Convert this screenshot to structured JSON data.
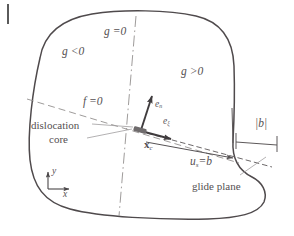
{
  "figure": {
    "domain_outline_color": "#4f4a4c",
    "dash_line_color": "#8d8a8c",
    "label_color": "#555052",
    "arrow_color": "#3f3b3d",
    "background": "#ffffff"
  },
  "labels": {
    "g_negative": "g <0",
    "g_zero": "g =0",
    "g_positive": "g >0",
    "f_zero": "f =0",
    "dislocation_core_line1": "dislocation",
    "dislocation_core_line2": "core",
    "e_n": "e",
    "e_n_sub": "n",
    "e_xi": "e",
    "e_xi_sub": "ξ",
    "x_c": "x",
    "x_c_sub": "c",
    "u_s": "u",
    "u_s_sub": "s",
    "u_s_eq": "=b",
    "burgers_magnitude": "|b|",
    "glide_plane": "glide plane",
    "axis_y": "y",
    "axis_x": "x"
  },
  "geometry": {
    "domain_path": "M 40,58 C 44,34 62,19 92,14 C 124,9 168,10 196,16 C 222,22 233,40 234,66 C 235,96 234,122 233,141 C 232,158 238,170 252,177 C 262,182 268,192 264,202 C 258,214 238,218 208,219 C 160,220 100,217 70,209 C 44,202 33,186 30,160 C 27,132 33,88 40,58 Z",
    "f_zero_line": {
      "x1": 27,
      "y1": 99,
      "x2": 239,
      "y2": 163
    },
    "g_zero_line": {
      "x1": 136,
      "y1": 16,
      "x2": 119,
      "y2": 216
    },
    "glide_plane_line": {
      "x1": 139,
      "y1": 131,
      "x2": 268,
      "y2": 166
    },
    "e_n_arrow": {
      "x1": 141,
      "y1": 131,
      "x2": 152,
      "y2": 94
    },
    "e_xi_arrow": {
      "x1": 141,
      "y1": 131,
      "x2": 176,
      "y2": 140
    },
    "slip_arrow": {
      "x1": 145,
      "y1": 142,
      "x2": 236,
      "y2": 159
    },
    "core_marker": {
      "cx": 140,
      "cy": 130,
      "w": 13,
      "h": 5,
      "angle": 16
    },
    "axes_origin": {
      "x": 48,
      "y": 189
    },
    "axes_y_length": 19,
    "axes_x_length": 22,
    "burgers_bracket": {
      "left": 236,
      "right": 277,
      "y": 142,
      "tick_height": 9
    }
  }
}
